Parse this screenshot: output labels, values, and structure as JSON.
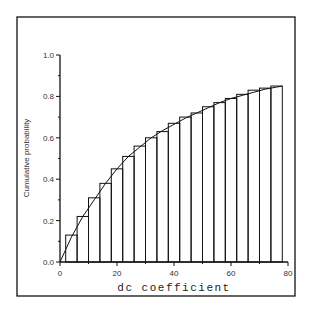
{
  "chart_data": {
    "type": "bar",
    "title": "",
    "xlabel": "dc coefficient",
    "ylabel": "Cumulative probability",
    "xlim": [
      0,
      80
    ],
    "ylim": [
      0,
      1.0
    ],
    "x_ticks": [
      "0",
      "20",
      "40",
      "60",
      "80"
    ],
    "y_ticks": [
      "0.0",
      "0.2",
      "0.4",
      "0.6",
      "0.8",
      "1.0"
    ],
    "grid": false,
    "legend": null,
    "bin_width": 4,
    "bin_edges": [
      2,
      6,
      10,
      14,
      18,
      22,
      26,
      30,
      34,
      38,
      42,
      46,
      50,
      54,
      58,
      62,
      66,
      70,
      74,
      78
    ],
    "categories": [
      "2-6",
      "6-10",
      "10-14",
      "14-18",
      "18-22",
      "22-26",
      "26-30",
      "30-34",
      "34-38",
      "38-42",
      "42-46",
      "46-50",
      "50-54",
      "54-58",
      "58-62",
      "62-66",
      "66-70",
      "70-74",
      "74-78"
    ],
    "values": [
      0.13,
      0.22,
      0.31,
      0.38,
      0.45,
      0.51,
      0.56,
      0.6,
      0.63,
      0.67,
      0.7,
      0.72,
      0.75,
      0.77,
      0.79,
      0.81,
      0.83,
      0.84,
      0.85
    ],
    "fitted_curve": {
      "name": "smooth CDF fit",
      "x": [
        0,
        4,
        8,
        12,
        16,
        20,
        24,
        28,
        32,
        36,
        40,
        44,
        48,
        52,
        56,
        60,
        64,
        68,
        72,
        76,
        78
      ],
      "y": [
        0.0,
        0.12,
        0.22,
        0.3,
        0.38,
        0.45,
        0.51,
        0.555,
        0.6,
        0.635,
        0.665,
        0.695,
        0.72,
        0.745,
        0.77,
        0.79,
        0.805,
        0.82,
        0.835,
        0.845,
        0.85
      ]
    }
  }
}
